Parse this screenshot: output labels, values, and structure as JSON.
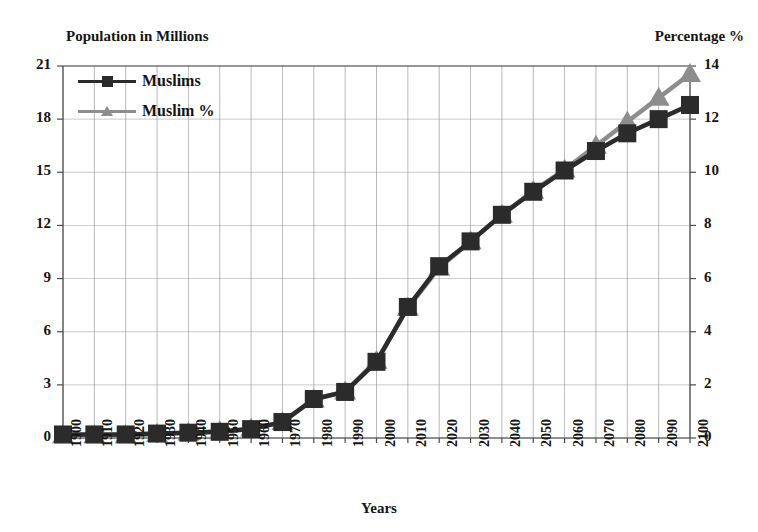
{
  "chart_data": {
    "type": "line",
    "title": "",
    "xlabel": "Years",
    "ylabel": "Population in Millions",
    "y2label": "Percentage %",
    "grid": true,
    "legend_position": "top-left",
    "xlim": [
      1900,
      2100
    ],
    "ylim": [
      0,
      21
    ],
    "y2lim": [
      0,
      14
    ],
    "x": [
      1900,
      1910,
      1920,
      1930,
      1940,
      1950,
      1960,
      1970,
      1980,
      1990,
      2000,
      2010,
      2020,
      2030,
      2040,
      2050,
      2060,
      2070,
      2080,
      2090,
      2100
    ],
    "categories": [
      "1900",
      "1910",
      "1920",
      "1930",
      "1940",
      "1950",
      "1960",
      "1970",
      "1980",
      "1990",
      "2000",
      "2010",
      "2020",
      "2030",
      "2040",
      "2050",
      "2060",
      "2070",
      "2080",
      "2090",
      "2100"
    ],
    "yticks": [
      0,
      3,
      6,
      9,
      12,
      15,
      18,
      21
    ],
    "ytick_labels": [
      "0",
      "3",
      "6",
      "9",
      "12",
      "15",
      "18",
      "21"
    ],
    "y2ticks": [
      0,
      2,
      4,
      6,
      8,
      10,
      12,
      14
    ],
    "y2tick_labels": [
      "0",
      "2",
      "4",
      "6",
      "8",
      "10",
      "12",
      "14"
    ],
    "series": [
      {
        "name": "Muslims",
        "axis": "left",
        "marker": "square",
        "color": "#2b2b2b",
        "values": [
          0.2,
          0.2,
          0.2,
          0.25,
          0.3,
          0.35,
          0.5,
          0.9,
          2.2,
          2.6,
          4.3,
          7.4,
          9.7,
          11.1,
          12.6,
          13.9,
          15.1,
          16.2,
          17.2,
          18.0,
          18.8
        ]
      },
      {
        "name": "Muslim %",
        "axis": "right",
        "marker": "triangle",
        "color": "#8d8d8d",
        "values": [
          0.1,
          0.1,
          0.1,
          0.15,
          0.2,
          0.25,
          0.35,
          0.6,
          1.45,
          1.75,
          2.9,
          4.9,
          6.4,
          7.4,
          8.4,
          9.3,
          10.1,
          11.0,
          11.9,
          12.8,
          13.7
        ]
      }
    ]
  },
  "legend": {
    "items": [
      {
        "label": "Muslims",
        "marker": "square",
        "color": "#2b2b2b"
      },
      {
        "label": "Muslim %",
        "marker": "triangle",
        "color": "#8d8d8d"
      }
    ]
  },
  "colors": {
    "muslims": "#2b2b2b",
    "muslim_pct": "#8d8d8d",
    "grid": "#8a8a8a",
    "axis": "#4a4a4a",
    "text": "#151515",
    "background": "#ffffff"
  }
}
